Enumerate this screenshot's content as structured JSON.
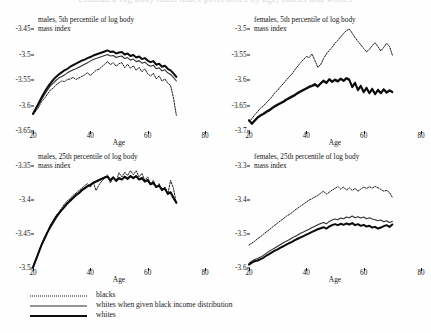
{
  "figure": {
    "cut_header_text": "estimated log body mass index percentiles by age, blacks and whites",
    "axis_color": "#111111"
  },
  "legend": {
    "items": [
      {
        "label": "blacks",
        "style": "dotted",
        "name": "legend-blacks"
      },
      {
        "label": "whites when given black income distribution",
        "style": "thin-solid",
        "name": "legend-whites-black-income"
      },
      {
        "label": "whites",
        "style": "thick-solid",
        "name": "legend-whites"
      }
    ]
  },
  "chart_data": [
    {
      "type": "line",
      "panel": "top-left",
      "title": "males, 5th percentile of log body\nmass index",
      "xlabel": "Age",
      "ylabel": "",
      "xlim": [
        20,
        80
      ],
      "ylim": [
        -3.65,
        -3.45
      ],
      "xticks": [
        20,
        40,
        60,
        80
      ],
      "yticks": [
        -3.45,
        -3.5,
        -3.55,
        -3.6,
        -3.65
      ],
      "grid": false,
      "legend_position": "below-figure",
      "x": [
        20,
        21,
        22,
        23,
        24,
        25,
        26,
        27,
        28,
        29,
        30,
        31,
        32,
        33,
        34,
        35,
        36,
        37,
        38,
        39,
        40,
        41,
        42,
        43,
        44,
        45,
        46,
        47,
        48,
        49,
        50,
        51,
        52,
        53,
        54,
        55,
        56,
        57,
        58,
        59,
        60,
        61,
        62,
        63,
        64,
        65,
        66,
        67,
        68,
        69,
        70
      ],
      "series": [
        {
          "name": "blacks",
          "values": [
            -3.618,
            -3.611,
            -3.603,
            -3.592,
            -3.586,
            -3.578,
            -3.57,
            -3.566,
            -3.56,
            -3.556,
            -3.552,
            -3.553,
            -3.549,
            -3.548,
            -3.545,
            -3.549,
            -3.546,
            -3.543,
            -3.54,
            -3.536,
            -3.541,
            -3.536,
            -3.531,
            -3.529,
            -3.524,
            -3.519,
            -3.514,
            -3.52,
            -3.516,
            -3.523,
            -3.518,
            -3.516,
            -3.526,
            -3.519,
            -3.527,
            -3.522,
            -3.531,
            -3.525,
            -3.534,
            -3.528,
            -3.538,
            -3.542,
            -3.537,
            -3.548,
            -3.542,
            -3.552,
            -3.548,
            -3.556,
            -3.561,
            -3.585,
            -3.619
          ]
        },
        {
          "name": "whites when given black income distribution",
          "values": [
            -3.617,
            -3.608,
            -3.598,
            -3.588,
            -3.579,
            -3.57,
            -3.562,
            -3.556,
            -3.551,
            -3.546,
            -3.543,
            -3.54,
            -3.536,
            -3.533,
            -3.53,
            -3.528,
            -3.525,
            -3.522,
            -3.519,
            -3.516,
            -3.513,
            -3.51,
            -3.508,
            -3.506,
            -3.504,
            -3.502,
            -3.5,
            -3.503,
            -3.502,
            -3.506,
            -3.504,
            -3.503,
            -3.508,
            -3.506,
            -3.511,
            -3.509,
            -3.514,
            -3.512,
            -3.517,
            -3.515,
            -3.52,
            -3.523,
            -3.521,
            -3.528,
            -3.526,
            -3.532,
            -3.53,
            -3.536,
            -3.539,
            -3.545,
            -3.552
          ]
        },
        {
          "name": "whites",
          "values": [
            -3.616,
            -3.606,
            -3.595,
            -3.584,
            -3.574,
            -3.565,
            -3.557,
            -3.55,
            -3.544,
            -3.539,
            -3.535,
            -3.531,
            -3.528,
            -3.524,
            -3.521,
            -3.518,
            -3.515,
            -3.512,
            -3.51,
            -3.507,
            -3.505,
            -3.502,
            -3.5,
            -3.498,
            -3.496,
            -3.494,
            -3.492,
            -3.495,
            -3.494,
            -3.498,
            -3.496,
            -3.495,
            -3.5,
            -3.498,
            -3.503,
            -3.501,
            -3.506,
            -3.504,
            -3.509,
            -3.507,
            -3.512,
            -3.515,
            -3.513,
            -3.52,
            -3.518,
            -3.524,
            -3.522,
            -3.528,
            -3.531,
            -3.537,
            -3.544
          ]
        }
      ]
    },
    {
      "type": "line",
      "panel": "top-right",
      "title": "females, 5th percentile of log body\nmass index",
      "xlabel": "Age",
      "ylabel": "",
      "xlim": [
        20,
        80
      ],
      "ylim": [
        -3.7,
        -3.5
      ],
      "xticks": [
        20,
        40,
        60,
        80
      ],
      "yticks": [
        -3.5,
        -3.55,
        -3.6,
        -3.65,
        -3.7
      ],
      "grid": false,
      "legend_position": "below-figure",
      "x": [
        20,
        21,
        22,
        23,
        24,
        25,
        26,
        27,
        28,
        29,
        30,
        31,
        32,
        33,
        34,
        35,
        36,
        37,
        38,
        39,
        40,
        41,
        42,
        43,
        44,
        45,
        46,
        47,
        48,
        49,
        50,
        51,
        52,
        53,
        54,
        55,
        56,
        57,
        58,
        59,
        60,
        61,
        62,
        63,
        64,
        65,
        66,
        67,
        68,
        69,
        70
      ],
      "series": [
        {
          "name": "blacks",
          "values": [
            -3.682,
            -3.676,
            -3.668,
            -3.662,
            -3.655,
            -3.651,
            -3.645,
            -3.639,
            -3.633,
            -3.625,
            -3.62,
            -3.613,
            -3.607,
            -3.6,
            -3.594,
            -3.588,
            -3.58,
            -3.573,
            -3.566,
            -3.56,
            -3.554,
            -3.556,
            -3.549,
            -3.562,
            -3.575,
            -3.57,
            -3.558,
            -3.549,
            -3.542,
            -3.536,
            -3.528,
            -3.522,
            -3.515,
            -3.509,
            -3.503,
            -3.5,
            -3.508,
            -3.517,
            -3.524,
            -3.531,
            -3.538,
            -3.545,
            -3.54,
            -3.532,
            -3.527,
            -3.535,
            -3.543,
            -3.536,
            -3.528,
            -3.534,
            -3.551
          ]
        },
        {
          "name": "whites when given black income distribution",
          "values": [
            -3.678,
            -3.684,
            -3.678,
            -3.672,
            -3.668,
            -3.665,
            -3.661,
            -3.658,
            -3.654,
            -3.65,
            -3.647,
            -3.644,
            -3.641,
            -3.637,
            -3.634,
            -3.631,
            -3.628,
            -3.624,
            -3.621,
            -3.618,
            -3.615,
            -3.612,
            -3.61,
            -3.607,
            -3.611,
            -3.605,
            -3.6,
            -3.604,
            -3.597,
            -3.602,
            -3.598,
            -3.601,
            -3.596,
            -3.6,
            -3.595,
            -3.598,
            -3.612,
            -3.604,
            -3.618,
            -3.61,
            -3.622,
            -3.614,
            -3.624,
            -3.616,
            -3.626,
            -3.618,
            -3.624,
            -3.617,
            -3.623,
            -3.619,
            -3.622
          ]
        },
        {
          "name": "whites",
          "values": [
            -3.679,
            -3.686,
            -3.68,
            -3.674,
            -3.67,
            -3.667,
            -3.663,
            -3.66,
            -3.656,
            -3.652,
            -3.649,
            -3.646,
            -3.643,
            -3.639,
            -3.636,
            -3.633,
            -3.63,
            -3.626,
            -3.623,
            -3.62,
            -3.617,
            -3.614,
            -3.612,
            -3.609,
            -3.613,
            -3.607,
            -3.602,
            -3.606,
            -3.599,
            -3.604,
            -3.6,
            -3.603,
            -3.598,
            -3.602,
            -3.597,
            -3.6,
            -3.614,
            -3.606,
            -3.62,
            -3.612,
            -3.624,
            -3.616,
            -3.626,
            -3.618,
            -3.628,
            -3.62,
            -3.626,
            -3.619,
            -3.625,
            -3.621,
            -3.624
          ]
        }
      ]
    },
    {
      "type": "line",
      "panel": "bottom-left",
      "title": "males, 25th percentile of log body\nmass index",
      "xlabel": "Age",
      "ylabel": "",
      "xlim": [
        20,
        80
      ],
      "ylim": [
        -3.5,
        -3.35
      ],
      "xticks": [
        20,
        40,
        60,
        80
      ],
      "yticks": [
        -3.35,
        -3.4,
        -3.45,
        -3.5
      ],
      "grid": false,
      "legend_position": "below-figure",
      "x": [
        20,
        21,
        22,
        23,
        24,
        25,
        26,
        27,
        28,
        29,
        30,
        31,
        32,
        33,
        34,
        35,
        36,
        37,
        38,
        39,
        40,
        41,
        42,
        43,
        44,
        45,
        46,
        47,
        48,
        49,
        50,
        51,
        52,
        53,
        54,
        55,
        56,
        57,
        58,
        59,
        60,
        61,
        62,
        63,
        64,
        65,
        66,
        67,
        68,
        69,
        70
      ],
      "series": [
        {
          "name": "blacks",
          "values": [
            -3.5,
            -3.489,
            -3.477,
            -3.466,
            -3.455,
            -3.447,
            -3.437,
            -3.43,
            -3.423,
            -3.418,
            -3.412,
            -3.406,
            -3.401,
            -3.398,
            -3.393,
            -3.39,
            -3.386,
            -3.383,
            -3.379,
            -3.376,
            -3.381,
            -3.374,
            -3.386,
            -3.378,
            -3.372,
            -3.368,
            -3.363,
            -3.375,
            -3.366,
            -3.372,
            -3.36,
            -3.366,
            -3.359,
            -3.364,
            -3.357,
            -3.363,
            -3.357,
            -3.366,
            -3.361,
            -3.371,
            -3.366,
            -3.377,
            -3.371,
            -3.382,
            -3.376,
            -3.387,
            -3.381,
            -3.392,
            -3.371,
            -3.383,
            -3.405
          ]
        },
        {
          "name": "whites when given black income distribution",
          "values": [
            -3.498,
            -3.487,
            -3.476,
            -3.465,
            -3.456,
            -3.447,
            -3.439,
            -3.432,
            -3.425,
            -3.419,
            -3.414,
            -3.409,
            -3.404,
            -3.4,
            -3.396,
            -3.392,
            -3.389,
            -3.385,
            -3.382,
            -3.379,
            -3.377,
            -3.374,
            -3.372,
            -3.37,
            -3.368,
            -3.366,
            -3.365,
            -3.37,
            -3.366,
            -3.371,
            -3.367,
            -3.369,
            -3.365,
            -3.368,
            -3.364,
            -3.367,
            -3.364,
            -3.369,
            -3.367,
            -3.372,
            -3.37,
            -3.376,
            -3.374,
            -3.38,
            -3.378,
            -3.384,
            -3.382,
            -3.39,
            -3.388,
            -3.396,
            -3.403
          ]
        },
        {
          "name": "whites",
          "values": [
            -3.499,
            -3.488,
            -3.477,
            -3.466,
            -3.457,
            -3.448,
            -3.44,
            -3.433,
            -3.426,
            -3.42,
            -3.415,
            -3.41,
            -3.405,
            -3.401,
            -3.397,
            -3.393,
            -3.39,
            -3.386,
            -3.383,
            -3.38,
            -3.378,
            -3.375,
            -3.373,
            -3.371,
            -3.369,
            -3.367,
            -3.366,
            -3.371,
            -3.367,
            -3.372,
            -3.368,
            -3.37,
            -3.366,
            -3.369,
            -3.365,
            -3.368,
            -3.365,
            -3.37,
            -3.368,
            -3.373,
            -3.371,
            -3.377,
            -3.375,
            -3.381,
            -3.379,
            -3.385,
            -3.383,
            -3.391,
            -3.389,
            -3.397,
            -3.404
          ]
        }
      ]
    },
    {
      "type": "line",
      "panel": "bottom-right",
      "title": "females, 25th percentile of log body\nmass index",
      "xlabel": "Age",
      "ylabel": "",
      "xlim": [
        20,
        80
      ],
      "ylim": [
        -3.6,
        -3.3
      ],
      "xticks": [
        20,
        40,
        60,
        80
      ],
      "yticks": [
        -3.3,
        -3.4,
        -3.5,
        -3.6
      ],
      "grid": false,
      "legend_position": "below-figure",
      "x": [
        20,
        21,
        22,
        23,
        24,
        25,
        26,
        27,
        28,
        29,
        30,
        31,
        32,
        33,
        34,
        35,
        36,
        37,
        38,
        39,
        40,
        41,
        42,
        43,
        44,
        45,
        46,
        47,
        48,
        49,
        50,
        51,
        52,
        53,
        54,
        55,
        56,
        57,
        58,
        59,
        60,
        61,
        62,
        63,
        64,
        65,
        66,
        67,
        68,
        69,
        70
      ],
      "series": [
        {
          "name": "blacks",
          "values": [
            -3.532,
            -3.527,
            -3.521,
            -3.514,
            -3.508,
            -3.501,
            -3.494,
            -3.488,
            -3.481,
            -3.474,
            -3.468,
            -3.461,
            -3.455,
            -3.448,
            -3.443,
            -3.437,
            -3.43,
            -3.424,
            -3.418,
            -3.412,
            -3.406,
            -3.4,
            -3.396,
            -3.391,
            -3.387,
            -3.38,
            -3.374,
            -3.383,
            -3.377,
            -3.371,
            -3.366,
            -3.36,
            -3.368,
            -3.362,
            -3.371,
            -3.364,
            -3.372,
            -3.366,
            -3.374,
            -3.368,
            -3.362,
            -3.366,
            -3.361,
            -3.365,
            -3.36,
            -3.364,
            -3.369,
            -3.374,
            -3.372,
            -3.378,
            -3.392
          ]
        },
        {
          "name": "whites when given black income distribution",
          "values": [
            -3.586,
            -3.58,
            -3.575,
            -3.572,
            -3.568,
            -3.563,
            -3.557,
            -3.551,
            -3.546,
            -3.541,
            -3.536,
            -3.531,
            -3.526,
            -3.521,
            -3.517,
            -3.512,
            -3.507,
            -3.503,
            -3.498,
            -3.494,
            -3.49,
            -3.486,
            -3.481,
            -3.477,
            -3.473,
            -3.469,
            -3.466,
            -3.47,
            -3.463,
            -3.459,
            -3.456,
            -3.458,
            -3.453,
            -3.455,
            -3.45,
            -3.452,
            -3.447,
            -3.452,
            -3.449,
            -3.453,
            -3.45,
            -3.455,
            -3.452,
            -3.456,
            -3.458,
            -3.461,
            -3.459,
            -3.464,
            -3.461,
            -3.466,
            -3.463
          ]
        },
        {
          "name": "whites",
          "values": [
            -3.59,
            -3.584,
            -3.58,
            -3.578,
            -3.574,
            -3.57,
            -3.564,
            -3.559,
            -3.554,
            -3.549,
            -3.545,
            -3.54,
            -3.536,
            -3.531,
            -3.527,
            -3.523,
            -3.518,
            -3.514,
            -3.51,
            -3.506,
            -3.502,
            -3.498,
            -3.494,
            -3.49,
            -3.486,
            -3.483,
            -3.48,
            -3.484,
            -3.478,
            -3.474,
            -3.471,
            -3.474,
            -3.47,
            -3.473,
            -3.469,
            -3.472,
            -3.468,
            -3.474,
            -3.471,
            -3.476,
            -3.473,
            -3.478,
            -3.476,
            -3.481,
            -3.479,
            -3.484,
            -3.481,
            -3.477,
            -3.474,
            -3.479,
            -3.472
          ]
        }
      ]
    }
  ]
}
